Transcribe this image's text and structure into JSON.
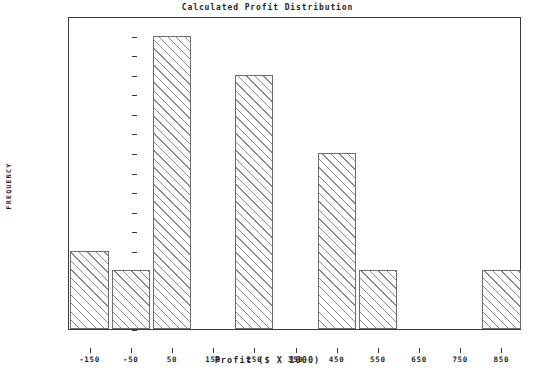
{
  "chart_data": {
    "type": "bar",
    "title": "Calculated Profit Distribution",
    "xlabel": "Profit ($ X 1000)",
    "ylabel": "FREQUENCY",
    "categories": [
      "-150",
      "-50",
      "50",
      "150",
      "250",
      "350",
      "450",
      "550",
      "650",
      "750",
      "850"
    ],
    "values": [
      0.08,
      0.06,
      0.3,
      0.0,
      0.26,
      0.0,
      0.18,
      0.06,
      0.0,
      0.0,
      0.06
    ],
    "ylim": [
      0.0,
      0.32
    ],
    "ytick_step": 0.02,
    "yticks": [
      "0.32",
      "0.30",
      "0.28",
      "0.26",
      "0.24",
      "0.22",
      "0.20",
      "0.18",
      "0.16",
      "0.14",
      "0.12",
      "0.10",
      "0.08",
      "0.06",
      "0.04",
      "0.02",
      "0.00"
    ],
    "ytick_values": [
      0.32,
      0.3,
      0.28,
      0.26,
      0.24,
      0.22,
      0.2,
      0.18,
      0.16,
      0.14,
      0.12,
      0.1,
      0.08,
      0.06,
      0.04,
      0.02,
      0.0
    ],
    "grid": false,
    "legend": null,
    "bar_style": {
      "fill": "diagonal-hatch",
      "face_color": "#ffffff",
      "hatch_color": "#8a8a8a",
      "edge_color": "#6e6e6e"
    },
    "frame_color": "#3a3a3a",
    "background_color": "#ffffff"
  }
}
